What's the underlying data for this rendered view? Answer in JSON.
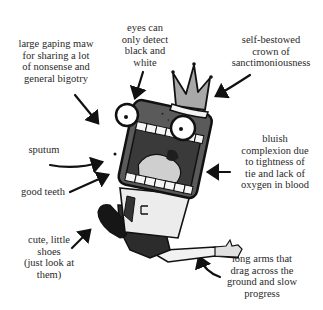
{
  "annotations": {
    "maw": "large gaping maw\nfor sharing a lot\nof nonsense and\ngeneral bigotry",
    "eyes": "eyes can\nonly detect\nblack and\nwhite",
    "crown": "self-bestowed\ncrown of\nsanctimoniousness",
    "sputum": "sputum",
    "complexion": "bluish\ncomplexion  due\nto tightness of\ntie and lack of\noxygen in blood",
    "teeth": "good teeth",
    "shoes": "cute, little\nshoes\n(just look at\nthem)",
    "arms": "long arms that\ndrag across the\nground and slow\nprogress"
  },
  "colors": {
    "ink": "#111111",
    "head": "#5a5a5a",
    "crown": "#a8a8a8",
    "mouth": "#3a3a3a",
    "tongue": "#cfcfcf",
    "shirt": "#e8e8e8",
    "pants": "#2c2c2c"
  }
}
